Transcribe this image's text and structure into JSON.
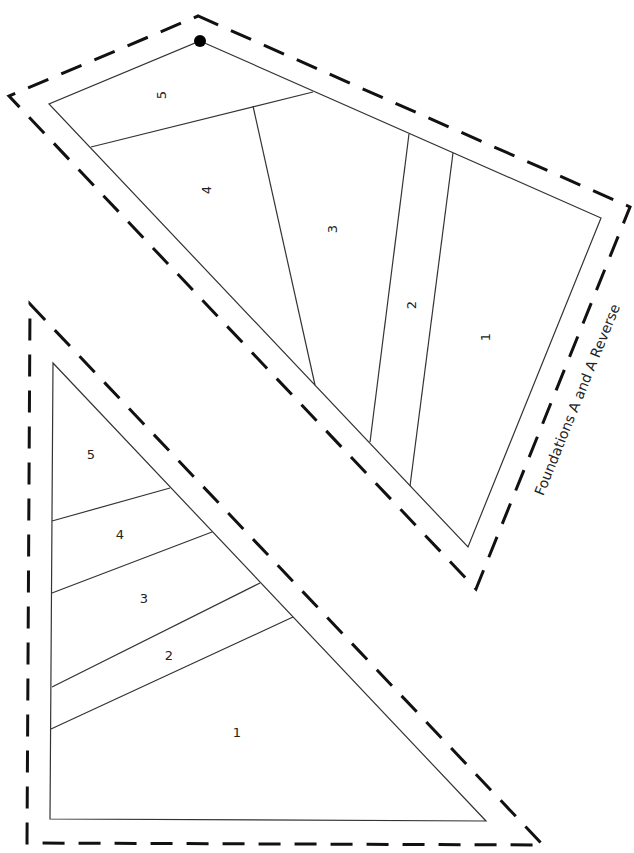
{
  "title": "Foundations A and A Reverse",
  "colors": {
    "line": "#333333",
    "seam": "#111111",
    "background": "#ffffff"
  },
  "foundation_top": {
    "name": "Foundation A",
    "sections": [
      {
        "label": "5"
      },
      {
        "label": "4"
      },
      {
        "label": "3"
      },
      {
        "label": "2"
      },
      {
        "label": "1"
      }
    ],
    "marker": "registration-dot"
  },
  "foundation_bottom": {
    "name": "Foundation A Reverse",
    "sections": [
      {
        "label": "5"
      },
      {
        "label": "4"
      },
      {
        "label": "3"
      },
      {
        "label": "2"
      },
      {
        "label": "1"
      }
    ]
  }
}
